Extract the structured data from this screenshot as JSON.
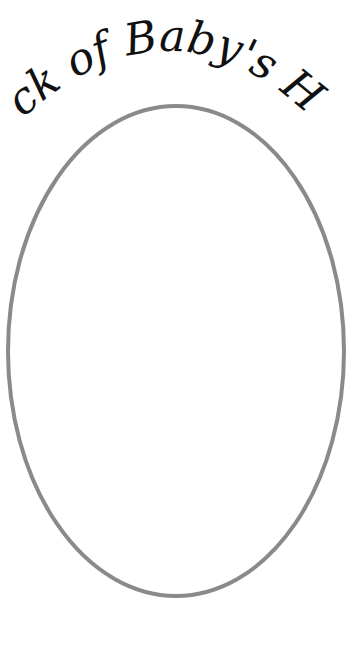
{
  "title": "Lock of Baby's Hair",
  "frame": {
    "shape": "oval",
    "stroke_color": "#8a8a8a",
    "fill_color": "#ffffff"
  }
}
